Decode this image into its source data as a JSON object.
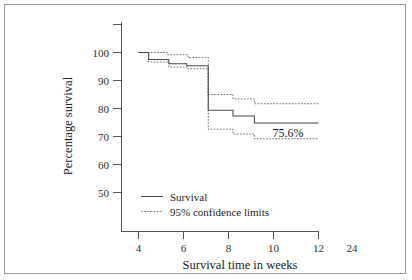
{
  "figure": {
    "border_color": "#9a9a9a",
    "background": "#ffffff"
  },
  "chart_data": {
    "type": "line",
    "subtype": "kaplan-meier-step",
    "title": "",
    "xlabel": "Survival time in weeks",
    "ylabel": "Percentage survival",
    "xlim": [
      3.2,
      13.6
    ],
    "ylim": [
      45,
      106
    ],
    "grid": false,
    "x_ticks": [
      4,
      6,
      8,
      10,
      12
    ],
    "x_tick_labels": [
      "4",
      "6",
      "8",
      "10",
      "12"
    ],
    "x_extra_labels": [
      {
        "label": "24",
        "x": 13.05,
        "has_tick": false
      }
    ],
    "y_ticks": [
      50,
      60,
      70,
      80,
      90,
      100
    ],
    "y_tick_labels": [
      "50",
      "60",
      "70",
      "80",
      "90",
      "100"
    ],
    "legend_position": "lower-left-inside",
    "annotations": [
      {
        "text": "75.6%",
        "x": 10.35,
        "y": 72.6
      }
    ],
    "series": [
      {
        "name": "Survival",
        "style": "solid",
        "color": "#4a4a4a",
        "step_points": [
          {
            "x": 4.0,
            "y": 100.0
          },
          {
            "x": 4.45,
            "y": 100.0
          },
          {
            "x": 4.45,
            "y": 97.5
          },
          {
            "x": 5.35,
            "y": 97.5
          },
          {
            "x": 5.35,
            "y": 96.0
          },
          {
            "x": 6.15,
            "y": 96.0
          },
          {
            "x": 6.15,
            "y": 95.3
          },
          {
            "x": 7.1,
            "y": 95.3
          },
          {
            "x": 7.1,
            "y": 79.4
          },
          {
            "x": 8.2,
            "y": 79.4
          },
          {
            "x": 8.2,
            "y": 77.3
          },
          {
            "x": 9.15,
            "y": 77.3
          },
          {
            "x": 9.15,
            "y": 74.8
          },
          {
            "x": 12.0,
            "y": 74.8
          }
        ]
      },
      {
        "name": "Upper 95% confidence limit",
        "style": "dotted",
        "color": "#6e6e6e",
        "step_points": [
          {
            "x": 4.0,
            "y": 100.0
          },
          {
            "x": 5.3,
            "y": 100.0
          },
          {
            "x": 5.3,
            "y": 99.2
          },
          {
            "x": 6.2,
            "y": 99.2
          },
          {
            "x": 6.2,
            "y": 98.2
          },
          {
            "x": 7.1,
            "y": 98.2
          },
          {
            "x": 7.1,
            "y": 85.0
          },
          {
            "x": 8.2,
            "y": 85.0
          },
          {
            "x": 8.2,
            "y": 83.4
          },
          {
            "x": 9.15,
            "y": 83.4
          },
          {
            "x": 9.15,
            "y": 81.7
          },
          {
            "x": 12.0,
            "y": 81.7
          }
        ]
      },
      {
        "name": "Lower 95% confidence limit",
        "style": "dotted",
        "color": "#6e6e6e",
        "step_points": [
          {
            "x": 4.0,
            "y": 100.0
          },
          {
            "x": 4.45,
            "y": 100.0
          },
          {
            "x": 4.45,
            "y": 96.6
          },
          {
            "x": 5.35,
            "y": 96.6
          },
          {
            "x": 5.35,
            "y": 94.8
          },
          {
            "x": 6.2,
            "y": 94.8
          },
          {
            "x": 6.2,
            "y": 94.2
          },
          {
            "x": 7.1,
            "y": 94.2
          },
          {
            "x": 7.1,
            "y": 72.6
          },
          {
            "x": 8.2,
            "y": 72.6
          },
          {
            "x": 8.2,
            "y": 70.9
          },
          {
            "x": 9.15,
            "y": 70.9
          },
          {
            "x": 9.15,
            "y": 69.2
          },
          {
            "x": 12.0,
            "y": 69.2
          }
        ]
      }
    ],
    "legend": [
      {
        "label": "Survival",
        "style": "solid"
      },
      {
        "label": "95% confidence limits",
        "style": "dotted"
      }
    ]
  }
}
